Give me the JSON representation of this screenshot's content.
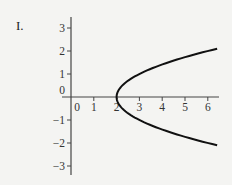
{
  "figure_label": "I.",
  "chart_data": {
    "type": "line",
    "title": "",
    "xlabel": "",
    "ylabel": "",
    "xlim": [
      -0.5,
      6.5
    ],
    "ylim": [
      -3.5,
      3.5
    ],
    "x_ticks": [
      "0",
      "1",
      "2",
      "3",
      "4",
      "5",
      "6"
    ],
    "y_ticks": [
      "3",
      "2",
      "1",
      "0",
      "-1",
      "-2",
      "-3"
    ],
    "grid": false,
    "series": [
      {
        "name": "x = y^2 + 2",
        "equation": "x = y^2 + 2",
        "y_range": [
          -2.1,
          2.1
        ],
        "vertex": [
          2,
          0
        ],
        "color": "#111111"
      }
    ]
  }
}
